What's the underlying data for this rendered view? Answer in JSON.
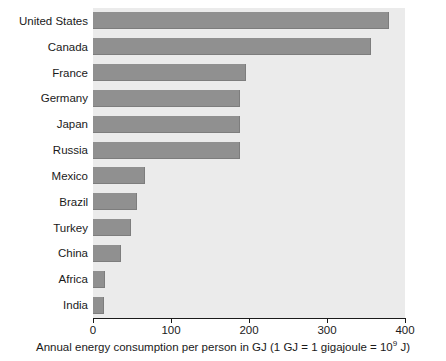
{
  "chart_data": {
    "type": "bar",
    "orientation": "horizontal",
    "title": "",
    "xlabel": "Annual energy consumption per person in GJ (1 GJ = 1 gigajoule = 10⁹ J)",
    "xlabel_main": "Annual energy consumption per person in GJ (1 GJ = 1 gigajoule = 10",
    "xlabel_sup": "9",
    "xlabel_tail": " J)",
    "ylabel": "",
    "categories": [
      "United States",
      "Canada",
      "France",
      "Germany",
      "Japan",
      "Russia",
      "Mexico",
      "Brazil",
      "Turkey",
      "China",
      "Africa",
      "India"
    ],
    "values": [
      380,
      356,
      196,
      188,
      188,
      188,
      67,
      56,
      49,
      36,
      16,
      14
    ],
    "xlim": [
      0,
      400
    ],
    "xticks": [
      0,
      100,
      200,
      300,
      400
    ],
    "xtick_labels": [
      "0",
      "100",
      "200",
      "300",
      "400"
    ],
    "grid": false,
    "legend": null,
    "bar_color": "#909090",
    "plot_background": "#ebebeb",
    "page_background": "#ffffff",
    "axis_color": "#1a1a1a"
  }
}
